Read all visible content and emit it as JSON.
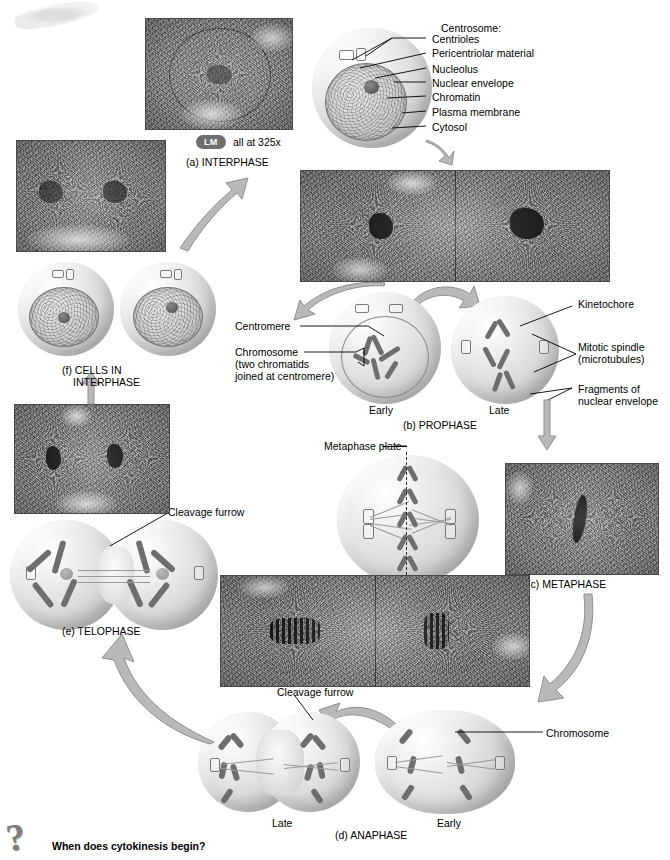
{
  "figure": {
    "magnification_badge": "LM",
    "magnification_note": "all at 325x"
  },
  "stages": {
    "a": {
      "key": "a",
      "label": "(a) INTERPHASE"
    },
    "b": {
      "key": "b",
      "label": "(b) PROPHASE",
      "sub_early": "Early",
      "sub_late": "Late"
    },
    "c": {
      "key": "c",
      "label": "(c) METAPHASE"
    },
    "d": {
      "key": "d",
      "label": "(d) ANAPHASE",
      "sub_early": "Early",
      "sub_late": "Late"
    },
    "e": {
      "key": "e",
      "label": "(e) TELOPHASE"
    },
    "f": {
      "key": "f",
      "label_line1": "(f) CELLS IN",
      "label_line2": "INTERPHASE"
    }
  },
  "interphase_labels": {
    "centrosome": "Centrosome:",
    "centrioles": "Centrioles",
    "pericentriolar": "Pericentriolar material",
    "nucleolus": "Nucleolus",
    "nuclear_envelope": "Nuclear envelope",
    "chromatin": "Chromatin",
    "plasma_membrane": "Plasma membrane",
    "cytosol": "Cytosol"
  },
  "prophase_labels": {
    "centromere": "Centromere",
    "chromosome_line1": "Chromosome",
    "chromosome_line2": "(two chromatids",
    "chromosome_line3": "joined at centromere)",
    "kinetochore": "Kinetochore",
    "spindle_line1": "Mitotic spindle",
    "spindle_line2": "(microtubules)",
    "fragments_line1": "Fragments of",
    "fragments_line2": "nuclear envelope"
  },
  "metaphase_labels": {
    "metaphase_plate": "Metaphase plate"
  },
  "anaphase_labels": {
    "cleavage_furrow": "Cleavage furrow",
    "chromosome": "Chromosome"
  },
  "telophase_labels": {
    "cleavage_furrow": "Cleavage furrow"
  },
  "question": {
    "icon": "question-mark-icon",
    "text": "When does cytokinesis begin?"
  },
  "colors": {
    "arrow_fill": "#b9b9b9",
    "arrow_stroke": "#8f8f8f",
    "badge_bg": "#6e6e6e",
    "text": "#000000",
    "chromosome": "#6e6e6e"
  }
}
